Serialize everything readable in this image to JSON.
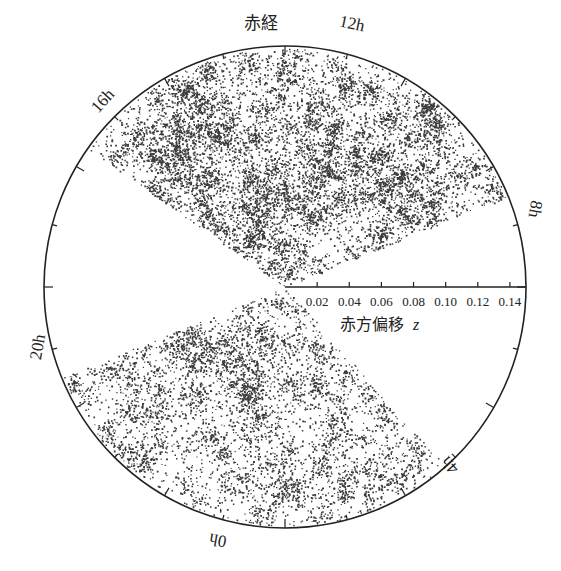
{
  "figure": {
    "title_label": "赤経",
    "axis_label": "赤方偏移",
    "axis_var": "z",
    "colors": {
      "ink": "#222222",
      "points": "#1a1a1a",
      "background": "#ffffff"
    },
    "circle": {
      "cx": 285,
      "cy": 287,
      "r": 241
    },
    "ra_labels": [
      {
        "text": "12h",
        "x": 352,
        "y": 29,
        "rotate": 12
      },
      {
        "text": "16h",
        "x": 103,
        "y": 106,
        "rotate": -48
      },
      {
        "text": "8h",
        "x": 535,
        "y": 214,
        "rotate": 100
      },
      {
        "text": "20h",
        "x": 38,
        "y": 352,
        "rotate": -80
      },
      {
        "text": "0h",
        "x": 218,
        "y": 545,
        "rotate": 190
      },
      {
        "text": "4h",
        "x": 450,
        "y": 470,
        "rotate": 228
      }
    ],
    "z_axis": {
      "ticks": [
        "0.02",
        "0.04",
        "0.06",
        "0.08",
        "0.10",
        "0.12",
        "0.14"
      ],
      "max": 0.15
    },
    "wedges": [
      {
        "name": "upper",
        "start_deg": 22,
        "end_deg": 145,
        "n_points": 9000,
        "seed": 7
      },
      {
        "name": "lower",
        "start_deg": 202,
        "end_deg": 312,
        "n_points": 5200,
        "seed": 13
      }
    ]
  },
  "chart_data": {
    "type": "scatter",
    "title": "赤経",
    "xlabel": "赤方偏移 z",
    "ylabel": "",
    "projection": "polar cone (right ascension vs redshift)",
    "r_ticks": [
      0.02,
      0.04,
      0.06,
      0.08,
      0.1,
      0.12,
      0.14
    ],
    "r_range": [
      0,
      0.15
    ],
    "angular_labels": [
      "12h",
      "8h",
      "4h",
      "0h",
      "20h",
      "16h"
    ],
    "series": [
      {
        "name": "northern slice (≈8h–16h)",
        "ra_range_h": [
          8,
          16.5
        ],
        "description": "dense galaxy points showing filaments and voids"
      },
      {
        "name": "southern slice (≈20h–4h)",
        "ra_range_h": [
          20.5,
          4
        ],
        "description": "galaxy points showing web-like large scale structure"
      }
    ],
    "grid": false,
    "legend": null
  }
}
